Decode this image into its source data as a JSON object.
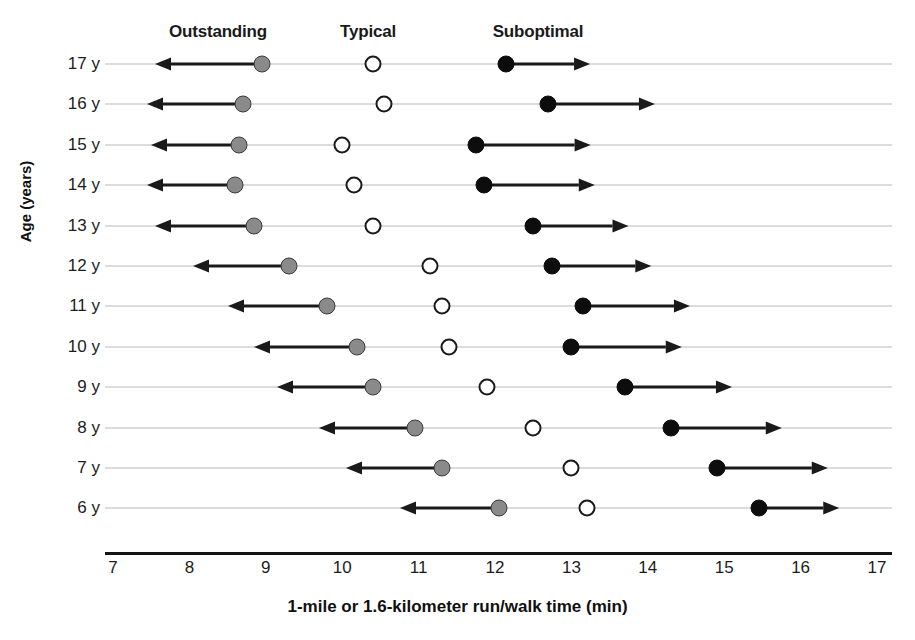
{
  "chart_data": {
    "type": "scatter",
    "title": "",
    "xlabel": "1-mile or 1.6-kilometer run/walk time (min)",
    "ylabel": "Age (years)",
    "xlim": [
      7,
      17
    ],
    "xticks": [
      "7",
      "8",
      "9",
      "10",
      "11",
      "12",
      "13",
      "14",
      "15",
      "16",
      "17"
    ],
    "yticks": [
      "17 y",
      "16 y",
      "15 y",
      "14 y",
      "13 y",
      "12 y",
      "11 y",
      "10 y",
      "9 y",
      "8 y",
      "7 y",
      "6 y"
    ],
    "grid": true,
    "legend_position": "top",
    "categories": [
      {
        "key": "outstanding",
        "label": "Outstanding",
        "marker": "gray-filled-circle",
        "color": "#8a8a8a",
        "arrow": "left",
        "header_x": 218
      },
      {
        "key": "typical",
        "label": "Typical",
        "marker": "open-circle",
        "color": "#ffffff",
        "arrow": "none",
        "header_x": 368
      },
      {
        "key": "suboptimal",
        "label": "Suboptimal",
        "marker": "black-filled-circle",
        "color": "#0d0d0d",
        "arrow": "right",
        "header_x": 538
      }
    ],
    "rows": [
      {
        "age": "17 y",
        "outstanding": 8.95,
        "typical": 10.4,
        "suboptimal": 12.15,
        "arrow_left_end": 7.55,
        "arrow_right_end": 13.25
      },
      {
        "age": "16 y",
        "outstanding": 8.7,
        "typical": 10.55,
        "suboptimal": 12.7,
        "arrow_left_end": 7.45,
        "arrow_right_end": 14.1
      },
      {
        "age": "15 y",
        "outstanding": 8.65,
        "typical": 10.0,
        "suboptimal": 11.75,
        "arrow_left_end": 7.5,
        "arrow_right_end": 13.25
      },
      {
        "age": "14 y",
        "outstanding": 8.6,
        "typical": 10.15,
        "suboptimal": 11.85,
        "arrow_left_end": 7.45,
        "arrow_right_end": 13.3
      },
      {
        "age": "13 y",
        "outstanding": 8.85,
        "typical": 10.4,
        "suboptimal": 12.5,
        "arrow_left_end": 7.55,
        "arrow_right_end": 13.75
      },
      {
        "age": "12 y",
        "outstanding": 9.3,
        "typical": 11.15,
        "suboptimal": 12.75,
        "arrow_left_end": 8.05,
        "arrow_right_end": 14.05
      },
      {
        "age": "11 y",
        "outstanding": 9.8,
        "typical": 11.3,
        "suboptimal": 13.15,
        "arrow_left_end": 8.5,
        "arrow_right_end": 14.55
      },
      {
        "age": "10 y",
        "outstanding": 10.2,
        "typical": 11.4,
        "suboptimal": 13.0,
        "arrow_left_end": 8.85,
        "arrow_right_end": 14.45
      },
      {
        "age": "9 y",
        "outstanding": 10.4,
        "typical": 11.9,
        "suboptimal": 13.7,
        "arrow_left_end": 9.15,
        "arrow_right_end": 15.1
      },
      {
        "age": "8 y",
        "outstanding": 10.95,
        "typical": 12.5,
        "suboptimal": 14.3,
        "arrow_left_end": 9.7,
        "arrow_right_end": 15.75
      },
      {
        "age": "7 y",
        "outstanding": 11.3,
        "typical": 13.0,
        "suboptimal": 14.9,
        "arrow_left_end": 10.05,
        "arrow_right_end": 16.35
      },
      {
        "age": "6 y",
        "outstanding": 12.05,
        "typical": 13.2,
        "suboptimal": 15.45,
        "arrow_left_end": 10.75,
        "arrow_right_end": 16.5
      }
    ]
  },
  "axis_geometry": {
    "x_origin_px": 113,
    "px_per_unit": 76.4,
    "row_top_px": 64,
    "row_step_px": 40.4,
    "grid_left_px": 105,
    "grid_right_px": 892
  }
}
